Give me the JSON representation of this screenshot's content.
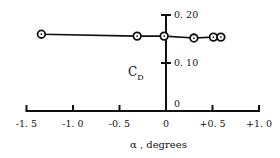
{
  "chart_data": {
    "type": "line",
    "title": "",
    "xlabel": "α , degrees",
    "ylabel": "C",
    "ylabel_subscript": "D",
    "xlim": [
      -1.5,
      1.0
    ],
    "ylim": [
      0,
      0.2
    ],
    "x_ticks": [
      -1.5,
      -1.0,
      -0.5,
      0,
      0.5,
      1.0
    ],
    "x_tick_labels": [
      "-1. 5",
      "-1. 0",
      "-0. 5",
      "0",
      "+0. 5",
      "+1. 0"
    ],
    "y_ticks": [
      0,
      0.1,
      0.2
    ],
    "y_tick_labels": [
      "0",
      "0. 10",
      "0. 20"
    ],
    "grid": false,
    "legend": "none",
    "series": [
      {
        "name": "CD",
        "marker": "circled-dot",
        "x": [
          -1.34,
          -0.31,
          -0.02,
          0.3,
          0.51,
          0.59
        ],
        "y": [
          0.16,
          0.156,
          0.156,
          0.152,
          0.154,
          0.154
        ]
      }
    ]
  }
}
